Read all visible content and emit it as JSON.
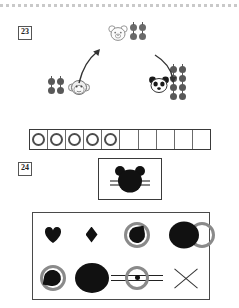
{
  "worksheet": {
    "exercise_23": {
      "number": "23",
      "type": "counting-cycle",
      "nodes": [
        {
          "id": "bear-top",
          "animal": "bear-face-icon",
          "apple_count": 4,
          "apple_rows": 2,
          "apple_cols": 2,
          "shade": "light"
        },
        {
          "id": "panda-right",
          "animal": "panda-face-icon",
          "apple_count": 8,
          "apple_rows": 4,
          "apple_cols": 2,
          "shade": "dark"
        },
        {
          "id": "monkey-left",
          "animal": "monkey-face-icon",
          "apple_count": 4,
          "apple_rows": 2,
          "apple_cols": 2,
          "shade": "dark"
        }
      ],
      "arrows": [
        {
          "id": "arrow-bear-to-panda",
          "direction": "down-right",
          "icon": "curved-arrow-icon"
        },
        {
          "id": "arrow-panda-to-monkey",
          "direction": "left",
          "icon": "curved-arrow-icon"
        },
        {
          "id": "arrow-monkey-to-bear",
          "direction": "up-right",
          "icon": "curved-arrow-icon"
        }
      ],
      "ten_frame": {
        "total_cells": 10,
        "filled_cells": 5,
        "token_icon": "ring-icon"
      }
    },
    "exercise_24": {
      "number": "24",
      "figure": {
        "icon": "bear-head-silhouette-icon",
        "description": "black bear head with whiskers"
      },
      "shapes": [
        {
          "id": "shape-1",
          "name": "heart-shape",
          "fill": "#111111"
        },
        {
          "id": "shape-2",
          "name": "diamond-shape",
          "fill": "#111111"
        },
        {
          "id": "shape-3",
          "name": "ring-with-pie-shape",
          "fill": "#111111",
          "ring": "#8a8a8a"
        },
        {
          "id": "shape-4",
          "name": "ellipse-over-ring-shape",
          "fill": "#111111",
          "ring": "#8a8a8a"
        },
        {
          "id": "shape-5",
          "name": "ring-with-blob-shape",
          "fill": "#111111",
          "ring": "#8a8a8a"
        },
        {
          "id": "shape-6",
          "name": "filled-circle-shape",
          "fill": "#111111"
        },
        {
          "id": "shape-7",
          "name": "target-with-lines-shape",
          "fill": "#111111",
          "ring": "#8a8a8a"
        },
        {
          "id": "shape-8",
          "name": "cross-x-shape",
          "stroke": "#333333"
        }
      ]
    }
  },
  "colors": {
    "apple_dark": "#585858",
    "apple_light": "#6a6a6a",
    "ink": "#111111",
    "ring_gray": "#8a8a8a",
    "rule_gray": "#c9c9c9"
  }
}
